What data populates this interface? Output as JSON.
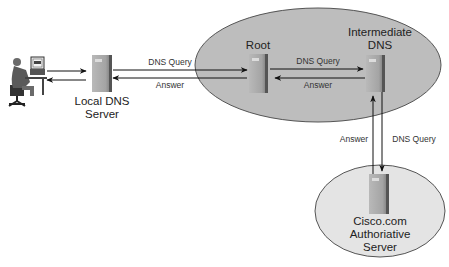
{
  "diagram": {
    "type": "dns-resolution-flow",
    "nodes": [
      {
        "id": "client",
        "label": "",
        "icon": "user-at-workstation-icon"
      },
      {
        "id": "local_dns",
        "label_line1": "Local DNS",
        "label_line2": "Server",
        "icon": "server-icon"
      },
      {
        "id": "root",
        "label": "Root",
        "icon": "server-icon"
      },
      {
        "id": "intermediate",
        "label_line1": "Intermediate",
        "label_line2": "DNS",
        "icon": "server-icon"
      },
      {
        "id": "authoritative",
        "label_line1": "Cisco.com",
        "label_line2": "Authoriative",
        "label_line3": "Server",
        "icon": "server-icon"
      }
    ],
    "edges": [
      {
        "from": "client",
        "to": "local_dns",
        "label": ""
      },
      {
        "from": "local_dns",
        "to": "client",
        "label": ""
      },
      {
        "from": "local_dns",
        "to": "root",
        "label": "DNS Query"
      },
      {
        "from": "root",
        "to": "local_dns",
        "label": "Answer"
      },
      {
        "from": "root",
        "to": "intermediate",
        "label": "DNS Query"
      },
      {
        "from": "intermediate",
        "to": "root",
        "label": "Answer"
      },
      {
        "from": "intermediate",
        "to": "authoritative",
        "label": "DNS Query"
      },
      {
        "from": "authoritative",
        "to": "intermediate",
        "label": "Answer"
      }
    ],
    "groups": [
      {
        "id": "upper-zone",
        "members": [
          "root",
          "intermediate"
        ],
        "fill": "#bdbdbd"
      },
      {
        "id": "lower-zone",
        "members": [
          "authoritative"
        ],
        "fill": "#e4e4e4"
      }
    ]
  }
}
